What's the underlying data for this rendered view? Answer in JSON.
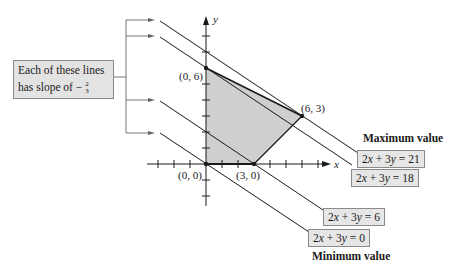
{
  "callout": {
    "line1": "Each of these lines",
    "line2_prefix": "has slope of −",
    "slope_num": "2",
    "slope_den": "3"
  },
  "axes": {
    "x_label": "x",
    "y_label": "y"
  },
  "points": [
    {
      "label": "(0, 6)",
      "x": 0,
      "y": 6
    },
    {
      "label": "(6, 3)",
      "x": 6,
      "y": 3
    },
    {
      "label": "(0, 0)",
      "x": 0,
      "y": 0
    },
    {
      "label": "(3, 0)",
      "x": 3,
      "y": 0
    }
  ],
  "lines": [
    {
      "equation_lhs": "2",
      "equation_var1": "x",
      "equation_mid": " + 3",
      "equation_var2": "y",
      "equation_rhs": " = 21",
      "c": 21
    },
    {
      "equation_lhs": "2",
      "equation_var1": "x",
      "equation_mid": " + 3",
      "equation_var2": "y",
      "equation_rhs": " = 18",
      "c": 18
    },
    {
      "equation_lhs": "2",
      "equation_var1": "x",
      "equation_mid": " + 3",
      "equation_var2": "y",
      "equation_rhs": " = 6",
      "c": 6
    },
    {
      "equation_lhs": "2",
      "equation_var1": "x",
      "equation_mid": " + 3",
      "equation_var2": "y",
      "equation_rhs": " = 0",
      "c": 0
    }
  ],
  "captions": {
    "maximum": "Maximum value",
    "minimum": "Minimum value"
  },
  "colors": {
    "region_fill": "#cfcfcf",
    "label_box_fill": "#e6e6e6",
    "line": "#1a1a1a"
  }
}
